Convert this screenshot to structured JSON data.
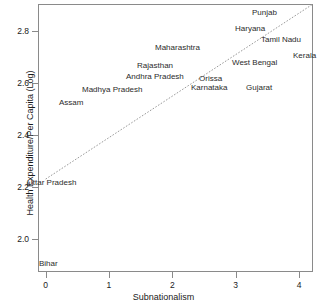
{
  "chart_data": {
    "type": "scatter",
    "title": "",
    "xlabel": "Subnationalism",
    "ylabel": "Health Expenditure/Per Capita (Log)",
    "xlim": [
      -0.12,
      4.22
    ],
    "ylim": [
      1.875,
      2.905
    ],
    "xticks": [
      0,
      1,
      2,
      3,
      4
    ],
    "xtick_labels": [
      "0",
      "1",
      "2",
      "3",
      "4"
    ],
    "yticks": [
      2.0,
      2.2,
      2.4,
      2.6,
      2.8
    ],
    "ytick_labels": [
      "2.0",
      "2.2",
      "2.4",
      "2.6",
      "2.8"
    ],
    "grid": false,
    "legend": null,
    "marker_style": "text-label",
    "fit_line": {
      "type": "linear-regression",
      "style": "dotted",
      "color": "#9a9a9a",
      "x_start": 0.0,
      "y_start": 2.232,
      "x_end": 4.22,
      "y_end": 2.905
    },
    "points": [
      {
        "label": "Bihar",
        "x": 0.05,
        "y": 1.905
      },
      {
        "label": "Uttar Pradesh",
        "x": 0.1,
        "y": 2.216
      },
      {
        "label": "Assam",
        "x": 0.4,
        "y": 2.523
      },
      {
        "label": "Madhya Pradesh",
        "x": 1.05,
        "y": 2.573
      },
      {
        "label": "Rajasthan",
        "x": 1.72,
        "y": 2.667
      },
      {
        "label": "Andhra Pradesh",
        "x": 1.72,
        "y": 2.625
      },
      {
        "label": "Maharashtra",
        "x": 2.08,
        "y": 2.735
      },
      {
        "label": "Orissa",
        "x": 2.6,
        "y": 2.617
      },
      {
        "label": "Karnataka",
        "x": 2.58,
        "y": 2.583
      },
      {
        "label": "Gujarat",
        "x": 3.36,
        "y": 2.583
      },
      {
        "label": "West Bengal",
        "x": 3.3,
        "y": 2.68
      },
      {
        "label": "Haryana",
        "x": 3.23,
        "y": 2.81
      },
      {
        "label": "Punjab",
        "x": 3.45,
        "y": 2.872
      },
      {
        "label": "Tamil Nadu",
        "x": 3.72,
        "y": 2.765
      },
      {
        "label": "Kerala",
        "x": 4.08,
        "y": 2.705
      }
    ]
  }
}
